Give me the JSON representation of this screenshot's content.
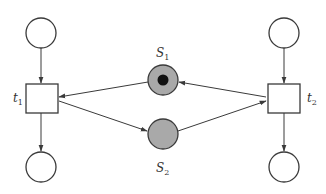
{
  "diagram": {
    "type": "petri-net",
    "places": [
      {
        "id": "p_top_left",
        "label": "",
        "cx": 41,
        "cy": 33,
        "tokens": 0
      },
      {
        "id": "p_top_right",
        "label": "",
        "cx": 284,
        "cy": 33,
        "tokens": 0
      },
      {
        "id": "S1",
        "label": "S",
        "sub": "1",
        "cx": 163,
        "cy": 80,
        "tokens": 1
      },
      {
        "id": "S2",
        "label": "S",
        "sub": "2",
        "cx": 163,
        "cy": 134,
        "tokens": 0
      },
      {
        "id": "p_bottom_left",
        "label": "",
        "cx": 41,
        "cy": 167,
        "tokens": 0
      },
      {
        "id": "p_bottom_right",
        "label": "",
        "cx": 284,
        "cy": 167,
        "tokens": 0
      }
    ],
    "transitions": [
      {
        "id": "t1",
        "label": "t",
        "sub": "1"
      },
      {
        "id": "t2",
        "label": "t",
        "sub": "2"
      }
    ],
    "arcs": [
      {
        "from": "p_top_left",
        "to": "t1"
      },
      {
        "from": "t1",
        "to": "p_bottom_left"
      },
      {
        "from": "S1",
        "to": "t1"
      },
      {
        "from": "t1",
        "to": "S2"
      },
      {
        "from": "S2",
        "to": "t2"
      },
      {
        "from": "t2",
        "to": "S1"
      },
      {
        "from": "p_top_right",
        "to": "t2"
      },
      {
        "from": "t2",
        "to": "p_bottom_right"
      }
    ],
    "colors": {
      "stroke": "#3a3a3a",
      "shared_place_fill": "#a9a9a9",
      "token": "#111111"
    }
  }
}
